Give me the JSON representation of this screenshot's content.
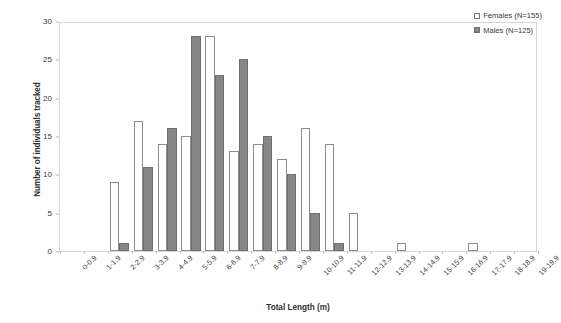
{
  "chart_data": {
    "type": "bar",
    "title": "",
    "xlabel": "Total Length (m)",
    "ylabel": "Number of individuals tracked",
    "categories": [
      "0-0.9",
      "1-1.9",
      "2-2.9",
      "3-3.9",
      "4-4.9",
      "5-5.9",
      "6-6.9",
      "7-7.9",
      "8-8.9",
      "9-9.9",
      "10-10.9",
      "11-11.9",
      "12-12.9",
      "13-13.9",
      "14-14.9",
      "15-15.9",
      "16-16.9",
      "17-17.9",
      "18-18.9",
      "19-19.9"
    ],
    "series": [
      {
        "name": "Females (N=155)",
        "color": "#ffffff",
        "edge_color": "#8d8d8d",
        "values": [
          0,
          0,
          9,
          17,
          14,
          15,
          28,
          13,
          14,
          12,
          16,
          14,
          5,
          0,
          1,
          0,
          0,
          1,
          0,
          0
        ]
      },
      {
        "name": "Males (N=125)",
        "color": "#878787",
        "edge_color": "#6e6e6e",
        "values": [
          0,
          0,
          1,
          11,
          16,
          28,
          23,
          25,
          15,
          10,
          5,
          1,
          0,
          0,
          0,
          0,
          0,
          0,
          0,
          0
        ]
      }
    ],
    "yticks": [
      0,
      5,
      10,
      15,
      20,
      25,
      30
    ],
    "ylim": [
      0,
      30
    ],
    "grid": false,
    "legend_position": "top-right"
  },
  "legend": {
    "entries": [
      {
        "label": "Females (N=155)",
        "swatch": "female"
      },
      {
        "label": "Males (N=125)",
        "swatch": "male"
      }
    ]
  }
}
